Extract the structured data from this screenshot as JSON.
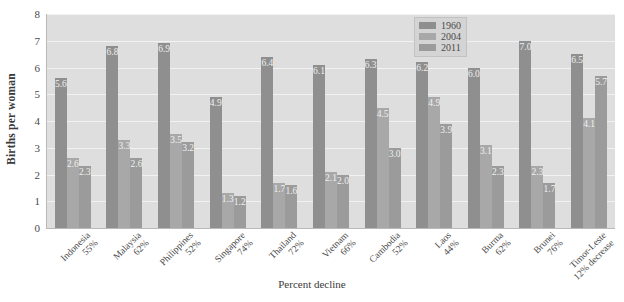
{
  "chart_data": {
    "type": "bar",
    "title": "",
    "xlabel": "Percent decline",
    "ylabel": "Births per woman",
    "ylim": [
      0,
      8
    ],
    "yticks": [
      0,
      1,
      2,
      3,
      4,
      5,
      6,
      7,
      8
    ],
    "grid": true,
    "legend_position": "top-right",
    "categories": [
      "Indonesia",
      "Malaysia",
      "Philippines",
      "Singapore",
      "Thailand",
      "Vietnam",
      "Cambodia",
      "Laos",
      "Burma",
      "Brunei",
      "Timor-Leste"
    ],
    "category_sublabels": [
      "55%",
      "62%",
      "52%",
      "74%",
      "72%",
      "66%",
      "52%",
      "44%",
      "62%",
      "76%",
      "12% decrease"
    ],
    "series": [
      {
        "name": "1960",
        "color": "#8f8f8f",
        "values": [
          5.6,
          6.8,
          6.9,
          4.9,
          6.4,
          6.1,
          6.3,
          6.2,
          6.0,
          7.0,
          6.5
        ]
      },
      {
        "name": "2004",
        "color": "#a8a8a8",
        "values": [
          2.6,
          3.3,
          3.5,
          1.3,
          1.7,
          2.1,
          4.5,
          4.9,
          3.1,
          2.3,
          4.1
        ]
      },
      {
        "name": "2011",
        "color": "#9b9b9b",
        "values": [
          2.3,
          2.6,
          3.2,
          1.2,
          1.6,
          2.0,
          3.0,
          3.9,
          2.3,
          1.7,
          5.7
        ]
      }
    ],
    "colors": {
      "plot_background": "#dedede",
      "gridline": "#f2f2f2",
      "axis": "#b9b9b9",
      "text": "#4a4a4a",
      "legend_background": "#d4d4d4"
    }
  }
}
